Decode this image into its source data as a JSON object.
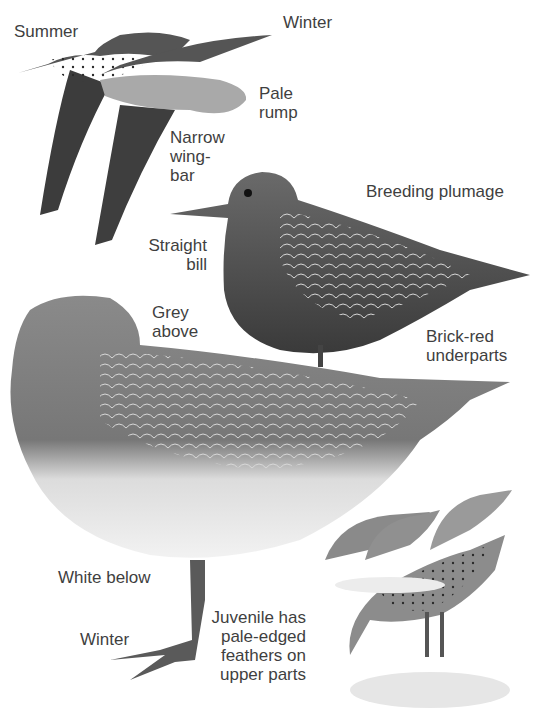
{
  "labels": {
    "summer": "Summer",
    "winter_flight": "Winter",
    "pale_rump": "Pale\nrump",
    "narrow_wingbar": "Narrow\nwing-\nbar",
    "breeding_plumage": "Breeding plumage",
    "straight_bill": "Straight\nbill",
    "grey_above": "Grey\nabove",
    "brick_red_underparts": "Brick-red\nunderparts",
    "white_below": "White below",
    "winter_standing": "Winter",
    "juvenile": "Juvenile has\npale-edged\nfeathers on\nupper parts"
  },
  "colors": {
    "background": "#ffffff",
    "text": "#3f3f3f",
    "dark_plumage": "#3a3a3a",
    "mid_plumage": "#7a7a7a",
    "light_plumage": "#c8c8c8"
  }
}
